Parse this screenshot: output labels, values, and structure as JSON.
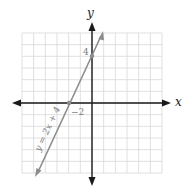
{
  "chart_data": {
    "type": "line",
    "title": "",
    "xlabel": "x",
    "ylabel": "y",
    "xlim": [
      -6,
      6
    ],
    "ylim": [
      -6,
      6
    ],
    "grid": true,
    "series": [
      {
        "name": "y = 2x + 4",
        "equation": "y = 2x + 4",
        "x": [
          -5,
          -2,
          0,
          1
        ],
        "y": [
          -6,
          0,
          4,
          6
        ]
      }
    ],
    "points": [
      {
        "x": -2,
        "y": 0,
        "label": "-2"
      },
      {
        "x": 0,
        "y": 4,
        "label": "4"
      }
    ]
  },
  "labels": {
    "x_axis": "x",
    "y_axis": "y",
    "line": "y = 2x + 4",
    "x_intercept": "−2",
    "y_intercept": "4"
  },
  "colors": {
    "grid": "#d8d8d8",
    "axis": "#1a1a1a",
    "line": "#8c8c8c",
    "label_gray": "#7a7a7a"
  }
}
